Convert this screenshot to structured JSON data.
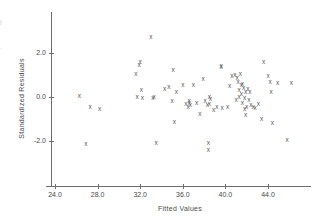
{
  "chart_data": {
    "type": "scatter",
    "title": "",
    "xlabel": "Fitted Values",
    "ylabel": "Standardized Residuals",
    "xlim": [
      23.0,
      47.5
    ],
    "ylim": [
      -3.1,
      3.2
    ],
    "xticks": [
      "24.0",
      "28.0",
      "32.0",
      "36.0",
      "40.0",
      "44.0"
    ],
    "xtick_values": [
      24.0,
      28.0,
      32.0,
      36.0,
      40.0,
      44.0
    ],
    "yticks": [
      "2.0",
      "0.0",
      "-2.0"
    ],
    "ytick_values": [
      2.0,
      0.0,
      -2.0
    ],
    "grid": false,
    "legend": null,
    "marker": "x",
    "marker_color": "#555555",
    "axis_color": "#6f6f6f",
    "background": "#ffffff",
    "n_points": 78,
    "x": [
      26.3,
      27.3,
      28.2,
      26.9,
      31.6,
      31.7,
      31.9,
      32.0,
      32.1,
      32.2,
      33.0,
      33.2,
      33.3,
      33.5,
      34.3,
      34.7,
      35.0,
      35.1,
      35.2,
      35.4,
      36.0,
      36.3,
      36.5,
      36.6,
      36.6,
      36.7,
      37.0,
      37.3,
      37.6,
      37.9,
      38.1,
      38.3,
      38.4,
      38.4,
      38.5,
      38.5,
      38.6,
      38.9,
      39.2,
      39.6,
      39.6,
      39.7,
      40.2,
      40.4,
      40.6,
      40.9,
      41.0,
      41.1,
      41.2,
      41.3,
      41.3,
      41.4,
      41.5,
      41.5,
      41.6,
      41.6,
      41.7,
      41.8,
      41.8,
      41.9,
      41.9,
      42.0,
      42.1,
      42.2,
      42.3,
      42.4,
      42.6,
      42.8,
      43.1,
      43.4,
      43.6,
      44.0,
      44.2,
      44.3,
      44.4,
      44.9,
      45.8,
      46.2
    ],
    "y": [
      0.05,
      -0.45,
      -0.55,
      -2.15,
      1.05,
      0.0,
      1.45,
      1.6,
      0.3,
      -0.05,
      2.75,
      -0.05,
      0.0,
      -2.1,
      0.35,
      0.45,
      -0.2,
      1.25,
      -1.15,
      0.25,
      0.55,
      -0.3,
      -0.45,
      -0.25,
      -0.2,
      -0.35,
      0.55,
      -0.25,
      -0.75,
      0.8,
      -0.2,
      -0.35,
      -2.1,
      -2.4,
      0.0,
      -0.3,
      -0.1,
      -0.6,
      -0.45,
      1.35,
      1.4,
      -0.5,
      -0.45,
      0.5,
      0.95,
      1.0,
      -0.15,
      0.85,
      0.7,
      0.3,
      0.0,
      1.05,
      0.55,
      0.15,
      -0.25,
      0.6,
      0.4,
      -0.05,
      -0.55,
      0.25,
      -0.8,
      -0.45,
      0.35,
      -0.15,
      0.25,
      -0.35,
      -0.45,
      -0.5,
      -0.3,
      -1.0,
      1.6,
      0.95,
      0.7,
      0.25,
      -1.2,
      0.65,
      -1.95,
      0.65
    ]
  },
  "edge_artifacts": {
    "lines": [
      "j",
      "·",
      "f",
      "j"
    ]
  }
}
